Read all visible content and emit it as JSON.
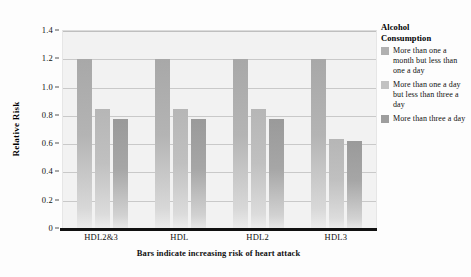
{
  "chart_data": {
    "type": "bar",
    "title": "",
    "subtitle": "",
    "caption": "Bars indicate increasing risk of heart attack",
    "xlabel": "",
    "ylabel": "Relative Risk",
    "categories": [
      "HDL2&3",
      "HDL",
      "HDL2",
      "HDL3"
    ],
    "ylim": [
      0,
      1.4
    ],
    "yticks": [
      "0",
      "0.2",
      "0.4",
      "0.6",
      "0.8",
      "1.0",
      "1.2",
      "1.4"
    ],
    "ytick_values": [
      0,
      0.2,
      0.4,
      0.6,
      0.8,
      1.0,
      1.2,
      1.4
    ],
    "grid": true,
    "legend_position": "right",
    "legend_title": "Alcohol Consumption",
    "series": [
      {
        "name": "More than one a month but less than one a day",
        "color": "#b0b0b0",
        "values": [
          1.2,
          1.2,
          1.2,
          1.2
        ]
      },
      {
        "name": "More than one a day but less than three a day",
        "color": "#c2c2c2",
        "values": [
          0.85,
          0.85,
          0.85,
          0.64
        ]
      },
      {
        "name": "More than three a day",
        "color": "#9e9e9e",
        "values": [
          0.78,
          0.78,
          0.78,
          0.62
        ]
      }
    ]
  },
  "legend": {
    "title_line1": "Alcohol",
    "title_line2": "Consumption",
    "items": [
      {
        "label": "More than one a month but less than one a day"
      },
      {
        "label": "More than one a day but less than three a day"
      },
      {
        "label": "More than three a day"
      }
    ]
  }
}
